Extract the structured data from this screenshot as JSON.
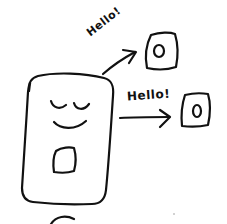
{
  "diagram": {
    "colors": {
      "background": "#ffffff",
      "ink": "#111111"
    },
    "nodes": [
      {
        "id": "phone-main",
        "kind": "smiling-phone",
        "features": [
          "closed-eyes",
          "smile",
          "home-button"
        ]
      },
      {
        "id": "device-1",
        "kind": "small-device",
        "features": [
          "circle-button"
        ]
      },
      {
        "id": "device-2",
        "kind": "small-device",
        "features": [
          "circle-button"
        ]
      }
    ],
    "edges": [
      {
        "from": "phone-main",
        "to": "device-1",
        "label": "Hello!"
      },
      {
        "from": "phone-main",
        "to": "device-2",
        "label": "Hello!"
      }
    ]
  },
  "labels": {
    "arrow_1": "Hello!",
    "arrow_2": "Hello!"
  }
}
